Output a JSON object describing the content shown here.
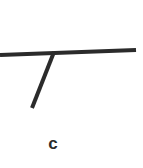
{
  "panel": {
    "caption": "c",
    "width": 143,
    "height": 168,
    "background_color": "#ffffff",
    "ink_color": "#2b2b2b"
  },
  "figure": {
    "strokes": [
      {
        "name": "horizontal-stroke",
        "x1": 0,
        "y1": 55,
        "x2": 136,
        "y2": 50,
        "width": 4
      },
      {
        "name": "diagonal-stroke",
        "x1": 54,
        "y1": 52,
        "x2": 32,
        "y2": 108,
        "width": 4
      }
    ]
  }
}
